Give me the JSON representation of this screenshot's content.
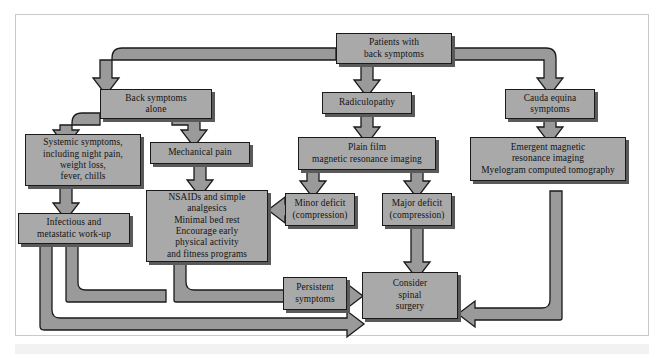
{
  "figure": {
    "type": "flowchart",
    "orientation": "top-down",
    "box_fill": "#a9a9a9",
    "box_border": "#1a1a1a",
    "shadow_color": "#5a5a5a",
    "connector_fill": "#9a9a9a",
    "connector_outline": "#1a1a1a",
    "frame_border": "#c9c9c9",
    "background": "#ffffff"
  },
  "nodes": {
    "patients": {
      "id": "patients",
      "label": "Patients with\nback symptoms",
      "lines": [
        "Patients with",
        "back symptoms"
      ]
    },
    "back_alone": {
      "id": "back_alone",
      "label": "Back symptoms\nalone",
      "lines": [
        "Back symptoms",
        "alone"
      ]
    },
    "radiculopathy": {
      "id": "radiculopathy",
      "label": "Radiculopathy",
      "lines": [
        "Radiculopathy"
      ]
    },
    "cauda": {
      "id": "cauda",
      "label": "Cauda equina\nsymptoms",
      "lines": [
        "Cauda equina",
        "symptoms"
      ]
    },
    "systemic": {
      "id": "systemic",
      "label": "Systemic symptoms,\nincluding night pain,\nweight loss,\nfever, chills",
      "lines": [
        "Systemic symptoms,",
        "including night pain,",
        "weight loss,",
        "fever, chills"
      ]
    },
    "mechanical": {
      "id": "mechanical",
      "label": "Mechanical pain",
      "lines": [
        "Mechanical pain"
      ]
    },
    "plain_film": {
      "id": "plain_film",
      "label": "Plain film\nmagnetic resonance imaging",
      "lines": [
        "Plain film",
        "magnetic resonance imaging"
      ]
    },
    "emergent": {
      "id": "emergent",
      "label": "Emergent magnetic\nresonance imaging\nMyelogram computed tomography",
      "lines": [
        "Emergent magnetic",
        "resonance imaging",
        "Myelogram computed tomography"
      ]
    },
    "nsaids": {
      "id": "nsaids",
      "label": "NSAIDs and simple\nanalgesics\nMinimal bed rest\nEncourage early\nphysical activity\nand fitness programs",
      "lines": [
        "NSAIDs and simple",
        "analgesics",
        "Minimal bed rest",
        "Encourage early",
        "physical activity",
        "and fitness programs"
      ]
    },
    "minor_deficit": {
      "id": "minor_deficit",
      "label": "Minor deficit\n(compression)",
      "lines": [
        "Minor deficit",
        "(compression)"
      ]
    },
    "major_deficit": {
      "id": "major_deficit",
      "label": "Major deficit\n(compression)",
      "lines": [
        "Major deficit",
        "(compression)"
      ]
    },
    "infectious": {
      "id": "infectious",
      "label": "Infectious and\nmetastatic work-up",
      "lines": [
        "Infectious and",
        "metastatic work-up"
      ]
    },
    "persistent": {
      "id": "persistent",
      "label": "Persistent\nsymptoms",
      "lines": [
        "Persistent",
        "symptoms"
      ]
    },
    "surgery": {
      "id": "surgery",
      "label": "Consider\nspinal\nsurgery",
      "lines": [
        "Consider",
        "spinal",
        "surgery"
      ]
    }
  },
  "edges": [
    {
      "from": "patients",
      "to": "back_alone",
      "style": "elbow-left-down-arrow"
    },
    {
      "from": "patients",
      "to": "radiculopathy",
      "style": "straight-down-arrow"
    },
    {
      "from": "patients",
      "to": "cauda",
      "style": "elbow-right-down-arrow"
    },
    {
      "from": "back_alone",
      "to": "systemic",
      "style": "elbow-left-down-arrow"
    },
    {
      "from": "back_alone",
      "to": "mechanical",
      "style": "elbow-right-down-arrow"
    },
    {
      "from": "systemic",
      "to": "infectious",
      "style": "straight-down-arrow"
    },
    {
      "from": "mechanical",
      "to": "nsaids",
      "style": "straight-down-arrow"
    },
    {
      "from": "radiculopathy",
      "to": "plain_film",
      "style": "straight-down-arrow"
    },
    {
      "from": "plain_film",
      "to": "minor_deficit",
      "style": "straight-down-arrow"
    },
    {
      "from": "plain_film",
      "to": "major_deficit",
      "style": "straight-down-arrow"
    },
    {
      "from": "cauda",
      "to": "emergent",
      "style": "straight-down-arrow"
    },
    {
      "from": "minor_deficit",
      "to": "nsaids",
      "style": "straight-left-arrow"
    },
    {
      "from": "nsaids",
      "to": "persistent",
      "style": "elbow-down-right-arrow"
    },
    {
      "from": "persistent",
      "to": "surgery",
      "style": "straight-right-arrow"
    },
    {
      "from": "major_deficit",
      "to": "surgery",
      "style": "straight-down-arrow"
    },
    {
      "from": "emergent",
      "to": "surgery",
      "style": "elbow-down-left-arrow"
    },
    {
      "from": "infectious",
      "to": "persistent",
      "style": "elbow-down-right-arrow"
    },
    {
      "from": "infectious",
      "to": "surgery",
      "style": "elbow-down-right-long-arrow"
    }
  ]
}
